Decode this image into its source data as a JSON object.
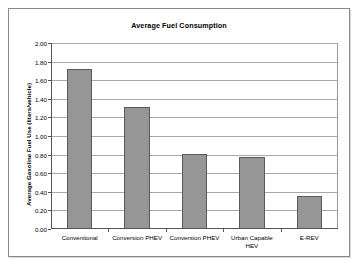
{
  "chart_data": {
    "type": "bar",
    "title": "Average Fuel Consumption",
    "xlabel": "",
    "ylabel": "Average Gasoline Fuel Use (liters/vehicle)",
    "categories": [
      "Conventional",
      "Conversion PHEV",
      "Conversion PHEV",
      "Urban Capable\nHEV",
      "E-REV"
    ],
    "values": [
      1.72,
      1.31,
      0.81,
      0.77,
      0.35
    ],
    "ylim": [
      0.0,
      2.0
    ],
    "ytick_step": 0.2,
    "ytick_labels": [
      "0.00",
      "0.20",
      "0.40",
      "0.60",
      "0.80",
      "1.00",
      "1.20",
      "1.40",
      "1.60",
      "1.80",
      "2.00"
    ],
    "grid": true,
    "legend": false,
    "legend_position": "none",
    "bar_color": "#969696",
    "bar_border_color": "#5a5a5a",
    "gridline_color": "#a8a8a8",
    "axis_color": "#555555",
    "plot_background": "#ffffff"
  }
}
